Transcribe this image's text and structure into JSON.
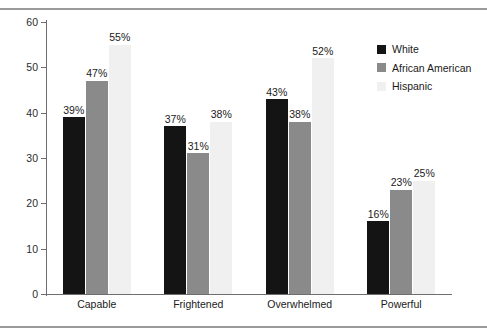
{
  "chart_data": {
    "type": "bar",
    "title": "",
    "subtitle": "",
    "xlabel": "",
    "ylabel": "",
    "ylim": [
      0,
      60
    ],
    "ytick_step": 10,
    "yticks": [
      0,
      10,
      20,
      30,
      40,
      50,
      60
    ],
    "grid": false,
    "legend_position": "right-top",
    "categories": [
      "Capable",
      "Frightened",
      "Overwhelmed",
      "Powerful"
    ],
    "series": [
      {
        "name": "White",
        "color": "#141414",
        "values": [
          39,
          37,
          43,
          16
        ],
        "labels": [
          "39%",
          "37%",
          "43%",
          "16%"
        ]
      },
      {
        "name": "African American",
        "color": "#8a8a8a",
        "values": [
          47,
          31,
          38,
          23
        ],
        "labels": [
          "47%",
          "31%",
          "38%",
          "23%"
        ]
      },
      {
        "name": "Hispanic",
        "color": "#f0f0f0",
        "values": [
          55,
          38,
          52,
          25
        ],
        "labels": [
          "55%",
          "38%",
          "52%",
          "25%"
        ]
      }
    ]
  },
  "axis": {
    "y_tick_labels": [
      "60",
      "50",
      "40",
      "30",
      "20",
      "10",
      "0"
    ]
  },
  "legend": {
    "entries": [
      {
        "label": "White",
        "color": "#141414"
      },
      {
        "label": "African American",
        "color": "#8a8a8a"
      },
      {
        "label": "Hispanic",
        "color": "#f0f0f0"
      }
    ]
  }
}
